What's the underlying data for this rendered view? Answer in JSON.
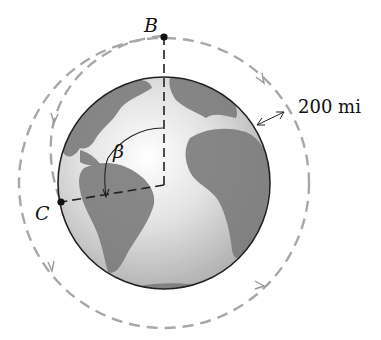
{
  "diagram": {
    "labels": {
      "point_b": "B",
      "point_c": "C",
      "angle": "β",
      "altitude": "200 mi"
    },
    "colors": {
      "orbit_dash": "#a8a8a8",
      "globe_ocean": "#d8d8d8",
      "globe_land": "#7a7a7a",
      "outline": "#222222"
    }
  }
}
